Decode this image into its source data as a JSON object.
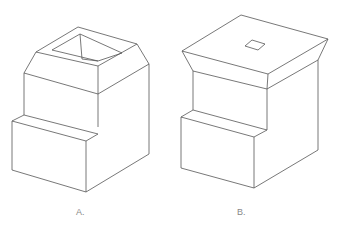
{
  "figures": [
    {
      "id": "A",
      "label": "A.",
      "description": "Isometric block with step at bottom, tapered (beveled outward) top with square tapered hole",
      "edges": [
        [
          [
            78,
            27
          ],
          [
            137,
            44
          ]
        ],
        [
          [
            78,
            27
          ],
          [
            36,
            52
          ]
        ],
        [
          [
            36,
            52
          ],
          [
            98,
            66
          ]
        ],
        [
          [
            98,
            66
          ],
          [
            137,
            44
          ]
        ],
        [
          [
            80,
            34
          ],
          [
            122,
            53
          ]
        ],
        [
          [
            80,
            34
          ],
          [
            52,
            50
          ]
        ],
        [
          [
            52,
            50
          ],
          [
            98,
            61
          ]
        ],
        [
          [
            98,
            61
          ],
          [
            122,
            53
          ]
        ],
        [
          [
            80,
            34
          ],
          [
            82,
            59
          ]
        ],
        [
          [
            82,
            59
          ],
          [
            98,
            61
          ]
        ],
        [
          [
            36,
            52
          ],
          [
            24,
            73
          ]
        ],
        [
          [
            98,
            66
          ],
          [
            98,
            94
          ]
        ],
        [
          [
            137,
            44
          ],
          [
            149,
            64
          ]
        ],
        [
          [
            24,
            73
          ],
          [
            98,
            94
          ]
        ],
        [
          [
            98,
            94
          ],
          [
            149,
            64
          ]
        ],
        [
          [
            24,
            73
          ],
          [
            24,
            115
          ]
        ],
        [
          [
            98,
            94
          ],
          [
            98,
            127
          ]
        ],
        [
          [
            149,
            64
          ],
          [
            149,
            154
          ]
        ],
        [
          [
            24,
            115
          ],
          [
            98,
            134
          ]
        ],
        [
          [
            24,
            115
          ],
          [
            12,
            121
          ]
        ],
        [
          [
            12,
            121
          ],
          [
            86,
            141
          ]
        ],
        [
          [
            86,
            141
          ],
          [
            98,
            134
          ]
        ],
        [
          [
            12,
            121
          ],
          [
            12,
            170
          ]
        ],
        [
          [
            86,
            141
          ],
          [
            86,
            192
          ]
        ],
        [
          [
            12,
            170
          ],
          [
            86,
            192
          ]
        ],
        [
          [
            86,
            192
          ],
          [
            149,
            154
          ]
        ]
      ]
    },
    {
      "id": "B",
      "label": "B.",
      "description": "Isometric block with step at bottom, inverted-tapered (flared) top with small square hole",
      "edges": [
        [
          [
            241,
            15
          ],
          [
            328,
            39
          ]
        ],
        [
          [
            241,
            15
          ],
          [
            182,
            51
          ]
        ],
        [
          [
            182,
            51
          ],
          [
            268,
            74
          ]
        ],
        [
          [
            268,
            74
          ],
          [
            328,
            39
          ]
        ],
        [
          [
            252,
            40
          ],
          [
            265,
            44
          ]
        ],
        [
          [
            252,
            40
          ],
          [
            245,
            46
          ]
        ],
        [
          [
            245,
            46
          ],
          [
            258,
            50
          ]
        ],
        [
          [
            258,
            50
          ],
          [
            265,
            44
          ]
        ],
        [
          [
            182,
            51
          ],
          [
            193,
            71
          ]
        ],
        [
          [
            268,
            74
          ],
          [
            267,
            89
          ]
        ],
        [
          [
            328,
            39
          ],
          [
            318,
            60
          ]
        ],
        [
          [
            193,
            71
          ],
          [
            267,
            89
          ]
        ],
        [
          [
            267,
            89
          ],
          [
            318,
            60
          ]
        ],
        [
          [
            193,
            71
          ],
          [
            193,
            110
          ]
        ],
        [
          [
            267,
            89
          ],
          [
            267,
            130
          ]
        ],
        [
          [
            318,
            60
          ],
          [
            318,
            150
          ]
        ],
        [
          [
            193,
            110
          ],
          [
            267,
            130
          ]
        ],
        [
          [
            193,
            110
          ],
          [
            181,
            117
          ]
        ],
        [
          [
            181,
            117
          ],
          [
            254,
            137
          ]
        ],
        [
          [
            254,
            137
          ],
          [
            267,
            130
          ]
        ],
        [
          [
            181,
            117
          ],
          [
            181,
            168
          ]
        ],
        [
          [
            254,
            137
          ],
          [
            254,
            188
          ]
        ],
        [
          [
            181,
            168
          ],
          [
            254,
            188
          ]
        ],
        [
          [
            254,
            188
          ],
          [
            318,
            150
          ]
        ]
      ]
    }
  ],
  "colors": {
    "line": "#555555",
    "label": "#888888",
    "background": "#ffffff"
  }
}
